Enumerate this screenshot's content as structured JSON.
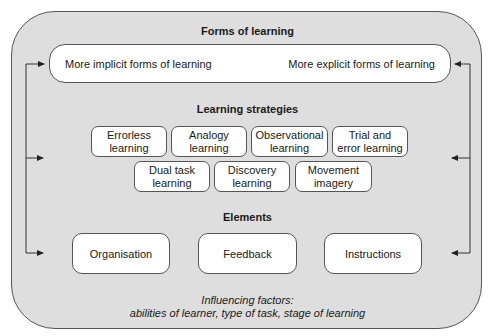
{
  "forms": {
    "title": "Forms of learning",
    "left_label": "More implicit forms of learning",
    "right_label": "More explicit forms of learning"
  },
  "strategies": {
    "title": "Learning strategies",
    "row1": [
      {
        "line1": "Errorless",
        "line2": "learning"
      },
      {
        "line1": "Analogy",
        "line2": "learning"
      },
      {
        "line1": "Observational",
        "line2": "learning"
      },
      {
        "line1": "Trial and",
        "line2": "error learning"
      }
    ],
    "row2": [
      {
        "line1": "Dual task",
        "line2": "learning"
      },
      {
        "line1": "Discovery",
        "line2": "learning"
      },
      {
        "line1": "Movement",
        "line2": "imagery"
      }
    ]
  },
  "elements": {
    "title": "Elements",
    "items": [
      "Organisation",
      "Feedback",
      "Instructions"
    ]
  },
  "influencing": {
    "line1": "Influencing factors:",
    "line2": "abilities of learner, type of task, stage of learning"
  },
  "colors": {
    "outer_fill": "#dedede",
    "box_fill": "#ffffff",
    "stroke": "#555555"
  }
}
